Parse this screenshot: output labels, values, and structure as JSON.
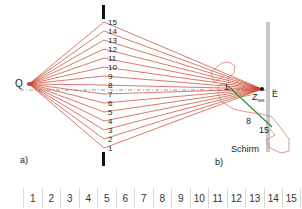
{
  "diagram": {
    "part_a": {
      "label": "a)",
      "source_label": "Q",
      "end_label": "E",
      "screen_label": "Schirm",
      "path_numbers": [
        "1",
        "2",
        "3",
        "4",
        "5",
        "6",
        "7",
        "8",
        "9",
        "10",
        "11",
        "12",
        "13",
        "14",
        "15"
      ]
    },
    "part_b": {
      "label": "b)",
      "start_label": "1",
      "mid_label": "8",
      "end_label": "15",
      "resultant_label": "Z",
      "resultant_subscript": "res"
    },
    "colors": {
      "rays": "#c8402a",
      "resultant": "#3a8a3a",
      "screen": "#c8c8c8",
      "barrier": "#111111"
    }
  },
  "strip": {
    "cells": [
      "1",
      "2",
      "3",
      "4",
      "5",
      "6",
      "7",
      "8",
      "9",
      "10",
      "11",
      "12",
      "13",
      "14",
      "15"
    ]
  }
}
